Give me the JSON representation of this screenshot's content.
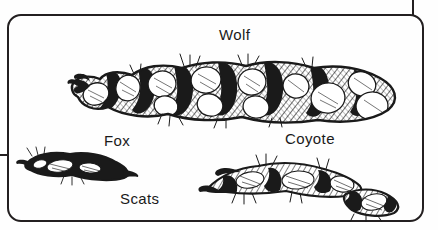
{
  "plate": {
    "caption": "Scats",
    "frame_color": "#231f20",
    "background_color": "#fefefe",
    "ink_color": "#1a1a1a",
    "medium": "pen-and-ink crosshatch illustration"
  },
  "specimens": [
    {
      "id": "wolf",
      "label": "Wolf",
      "icon": "wolf-scat-drawing",
      "description": "Large segmented rope-like scat with visible bone fragments and hair, tapered twisted tip at left"
    },
    {
      "id": "fox",
      "label": "Fox",
      "icon": "fox-scat-drawing",
      "description": "Small dark slender scat with fine tapered twist"
    },
    {
      "id": "coyote",
      "label": "Coyote",
      "icon": "coyote-scat-drawing",
      "description": "Elongated tapered scat with a separate smaller segment at lower right"
    }
  ],
  "leaders": {
    "top_right": "leader-line-top",
    "left": "leader-line-left"
  }
}
